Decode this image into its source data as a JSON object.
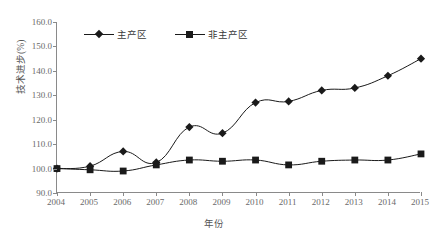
{
  "chart_data": {
    "type": "line",
    "title": "",
    "xlabel": "年份",
    "ylabel": "技术进步(%)",
    "categories": [
      "2004",
      "2005",
      "2006",
      "2007",
      "2008",
      "2009",
      "2010",
      "2011",
      "2012",
      "2013",
      "2014",
      "2015"
    ],
    "x": [
      2004,
      2005,
      2006,
      2007,
      2008,
      2009,
      2010,
      2011,
      2012,
      2013,
      2014,
      2015
    ],
    "xlim": [
      2004,
      2015
    ],
    "ylim": [
      90.0,
      160.0
    ],
    "ytick_labels": [
      "160.0",
      "150.0",
      "140.0",
      "130.0",
      "120.0",
      "110.0",
      "100.0",
      "90.0"
    ],
    "yticks": [
      160.0,
      150.0,
      140.0,
      130.0,
      120.0,
      110.0,
      100.0,
      90.0
    ],
    "grid": false,
    "legend_position": "top-left-inside",
    "series": [
      {
        "name": "主产区",
        "marker": "diamond",
        "color": "#1a1a1a",
        "values": [
          100.0,
          101.0,
          107.0,
          102.5,
          117.0,
          114.5,
          127.0,
          127.5,
          132.0,
          133.0,
          138.0,
          145.0
        ]
      },
      {
        "name": "非主产区",
        "marker": "square",
        "color": "#1a1a1a",
        "values": [
          100.0,
          99.5,
          99.0,
          101.5,
          103.5,
          103.0,
          103.5,
          101.5,
          103.0,
          103.5,
          103.5,
          106.0
        ]
      }
    ]
  }
}
